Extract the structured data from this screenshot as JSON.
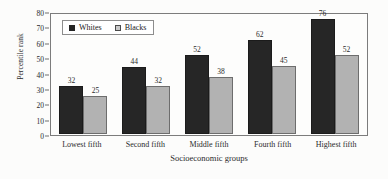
{
  "chart_data": {
    "type": "bar",
    "title": "",
    "xlabel": "Socioeconomic groups",
    "ylabel": "Percentile rank",
    "categories": [
      "Lowest fifth",
      "Second fifth",
      "Middle fifth",
      "Fourth fifth",
      "Highest fifth"
    ],
    "series": [
      {
        "name": "Whites",
        "color": "#262626",
        "values": [
          32,
          44,
          52,
          62,
          76
        ]
      },
      {
        "name": "Blacks",
        "color": "#b2b2b2",
        "values": [
          25,
          32,
          38,
          45,
          52
        ]
      }
    ],
    "ylim": [
      0,
      80
    ],
    "yticks": [
      0,
      10,
      20,
      30,
      40,
      50,
      60,
      70,
      80
    ],
    "ytick_labels": [
      "0",
      "10",
      "20",
      "30",
      "40",
      "50",
      "60",
      "70",
      "80"
    ],
    "grid": false,
    "legend_position": "top-left-inside",
    "data_labels": true,
    "legend": [
      {
        "label": "Whites",
        "swatch": "filled-dark-square"
      },
      {
        "label": "Blacks",
        "swatch": "outlined-light-square"
      }
    ]
  },
  "colors": {
    "background": "#fcfcfb",
    "frame": "#7c7c7c",
    "text": "#2b2b2b",
    "series_whites": "#262626",
    "series_blacks": "#b2b2b2"
  }
}
